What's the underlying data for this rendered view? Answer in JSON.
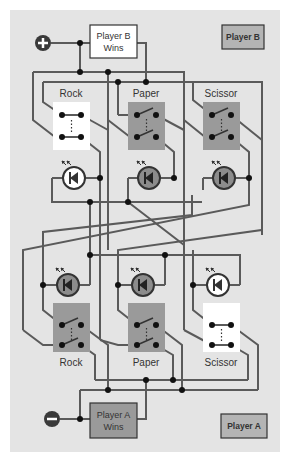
{
  "diagram": {
    "colors": {
      "panel": "#e4e4e4",
      "wire": "#5a5a5a",
      "switch_closed": "#9a9a9a",
      "switch_open": "#ffffff",
      "led_on": "#ffffff",
      "led_off": "#8c8c8c",
      "player_box": "#b4b4b4",
      "player_a_wins_box": "#9a9a9a",
      "player_b_wins_box": "#ffffff",
      "terminal": "#3a3a3a"
    },
    "terminals": {
      "positive": {
        "symbol": "+",
        "label": "positive-terminal"
      },
      "negative": {
        "symbol": "−",
        "label": "negative-terminal"
      }
    },
    "top": {
      "wins_box": {
        "line1": "Player B",
        "line2": "Wins"
      },
      "player_label": "Player B",
      "switches": [
        {
          "label": "Rock",
          "state": "open"
        },
        {
          "label": "Paper",
          "state": "closed"
        },
        {
          "label": "Scissor",
          "state": "closed"
        }
      ],
      "leds": [
        {
          "name": "rock",
          "state": "on"
        },
        {
          "name": "paper",
          "state": "off"
        },
        {
          "name": "scissor",
          "state": "off"
        }
      ]
    },
    "bottom": {
      "wins_box": {
        "line1": "Player A",
        "line2": "Wins"
      },
      "player_label": "Player A",
      "switches": [
        {
          "label": "Rock",
          "state": "closed"
        },
        {
          "label": "Paper",
          "state": "closed"
        },
        {
          "label": "Scissor",
          "state": "open"
        }
      ],
      "leds": [
        {
          "name": "rock",
          "state": "off"
        },
        {
          "name": "paper",
          "state": "off"
        },
        {
          "name": "scissor",
          "state": "on"
        }
      ]
    }
  }
}
